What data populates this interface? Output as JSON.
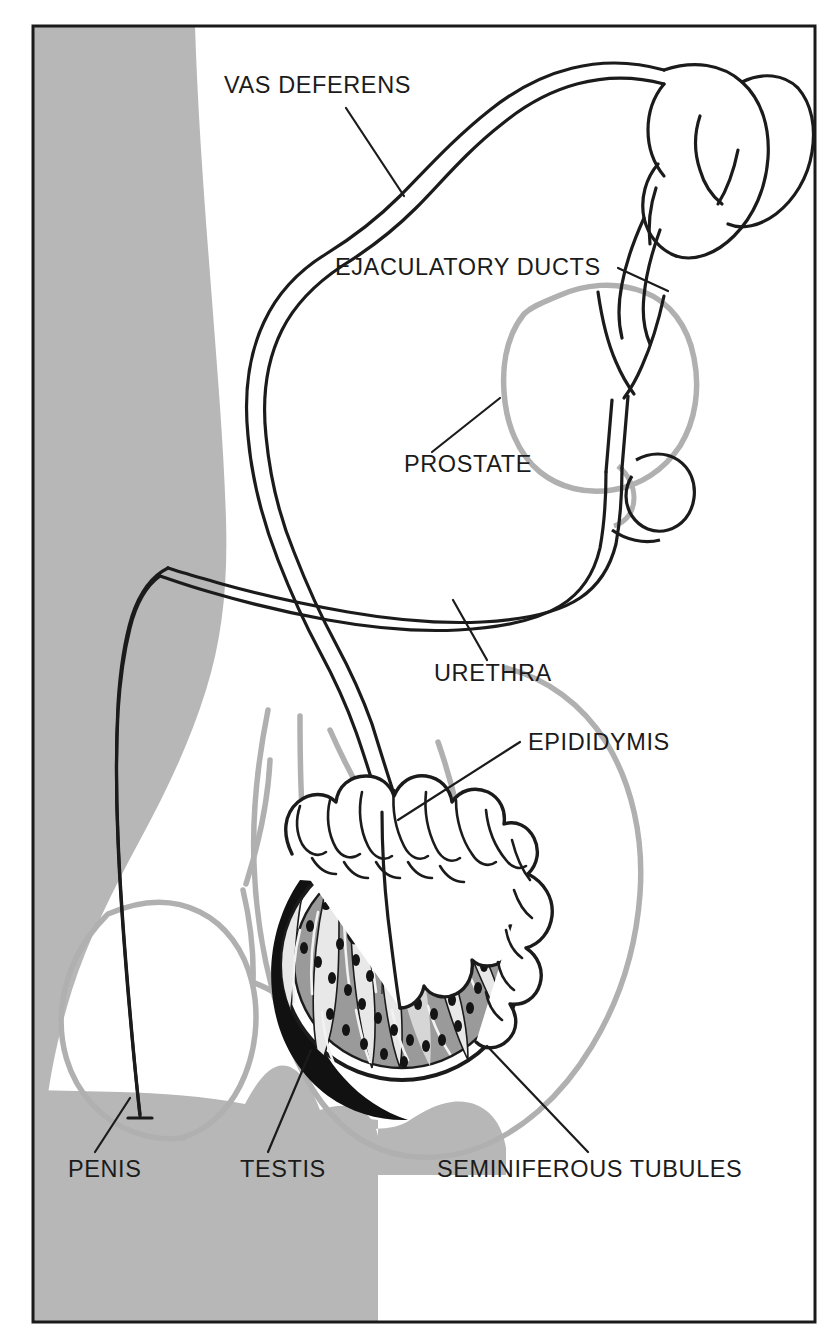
{
  "figure": {
    "kind": "anatomical-line-diagram",
    "frame": {
      "border_color": "#1a1a1a",
      "background_color": "#ffffff",
      "shaded_body_color": "#b7b7b7"
    },
    "colors": {
      "ink": "#1b1b1b",
      "organ_gray": "#b0b0b0",
      "tissue_gray": "#9a9a9a",
      "tissue_light": "#d6d6d6",
      "shadow_black": "#111111",
      "background": "#ffffff"
    }
  },
  "labels": [
    {
      "id": "vas-deferens",
      "text": "VAS DEFERENS",
      "x": 224,
      "y": 93,
      "anchor": "start"
    },
    {
      "id": "ejaculatory-ducts",
      "text": "EJACULATORY DUCTS",
      "x": 335,
      "y": 275,
      "anchor": "start"
    },
    {
      "id": "prostate",
      "text": "PROSTATE",
      "x": 404,
      "y": 472,
      "anchor": "start"
    },
    {
      "id": "urethra",
      "text": "URETHRA",
      "x": 434,
      "y": 681,
      "anchor": "start"
    },
    {
      "id": "epididymis",
      "text": "EPIDIDYMIS",
      "x": 528,
      "y": 750,
      "anchor": "start"
    },
    {
      "id": "penis",
      "text": "PENIS",
      "x": 68,
      "y": 1177,
      "anchor": "start"
    },
    {
      "id": "testis",
      "text": "TESTIS",
      "x": 240,
      "y": 1177,
      "anchor": "start"
    },
    {
      "id": "seminiferous-tubules",
      "text": "SEMINIFEROUS TUBULES",
      "x": 437,
      "y": 1177,
      "anchor": "start"
    }
  ],
  "leader_lines": [
    {
      "id": "leader-vas-deferens",
      "d": "M 346 108 L 404 196"
    },
    {
      "id": "leader-ejaculatory-ducts",
      "d": "M 618 268 L 668 291"
    },
    {
      "id": "leader-prostate",
      "d": "M 432 452 L 500 398"
    },
    {
      "id": "leader-urethra",
      "d": "M 487 660 L 453 600"
    },
    {
      "id": "leader-epididymis",
      "d": "M 520 742 L 398 820"
    },
    {
      "id": "leader-penis",
      "d": "M 95 1152 L 130 1098"
    },
    {
      "id": "leader-testis",
      "d": "M 268 1152 L 311 1050"
    },
    {
      "id": "leader-seminiferous-tubules",
      "d": "M 588 1152 L 487 1046"
    }
  ],
  "structures": [
    {
      "id": "body-silhouette",
      "name": "shaded body silhouette (thigh / perineum)"
    },
    {
      "id": "body-contour",
      "name": "gray body outline (scrotum, penis shaft, pelvic wall)"
    },
    {
      "id": "vas-deferens-tube",
      "name": "vas deferens double-line duct"
    },
    {
      "id": "seminal-vesicle",
      "name": "seminal vesicle lobed structure"
    },
    {
      "id": "prostate-gland",
      "name": "prostate gray outlined gland"
    },
    {
      "id": "ejaculatory-duct-y",
      "name": "ejaculatory ducts Y-junction"
    },
    {
      "id": "urethra-tube",
      "name": "urethra double-line duct to penis"
    },
    {
      "id": "bulbourethral",
      "name": "bulbourethral gland bulb"
    },
    {
      "id": "epididymis-coil",
      "name": "epididymis convoluted coil"
    },
    {
      "id": "testis-section",
      "name": "testis cut-away with lobules"
    },
    {
      "id": "seminiferous-coils",
      "name": "seminiferous tubule lobules with dark specks"
    }
  ]
}
